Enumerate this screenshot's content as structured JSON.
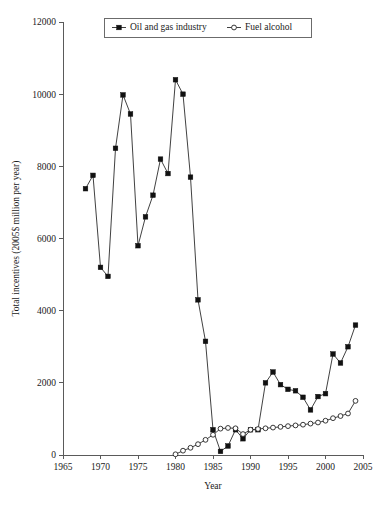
{
  "chart_data": {
    "type": "line",
    "title": "",
    "subtitle": "",
    "xlabel": "Year",
    "ylabel": "Total incentives (2005$ million per year)",
    "xlim": [
      1965,
      2005
    ],
    "ylim": [
      0,
      12000
    ],
    "xticks": [
      1965,
      1970,
      1975,
      1980,
      1985,
      1990,
      1995,
      2000,
      2005
    ],
    "yticks": [
      0,
      2000,
      4000,
      6000,
      8000,
      10000,
      12000
    ],
    "xtick_labels": [
      "1965",
      "1970",
      "1975",
      "1980",
      "1985",
      "1990",
      "1995",
      "2000",
      "2005"
    ],
    "ytick_labels": [
      "0",
      "2000",
      "4000",
      "6000",
      "8000",
      "10000",
      "12000"
    ],
    "grid": false,
    "legend_position": "top-center",
    "series": [
      {
        "name": "Oil and gas industry",
        "marker": "filled-square",
        "color": "#111111",
        "x": [
          1968,
          1969,
          1970,
          1971,
          1972,
          1973,
          1974,
          1975,
          1976,
          1977,
          1978,
          1979,
          1980,
          1981,
          1982,
          1983,
          1984,
          1985,
          1986,
          1987,
          1988,
          1989,
          1990,
          1991,
          1992,
          1993,
          1994,
          1995,
          1996,
          1997,
          1998,
          1999,
          2000,
          2001,
          2002,
          2003,
          2004
        ],
        "values": [
          7380,
          7750,
          5200,
          4950,
          8500,
          9980,
          9450,
          5800,
          6600,
          7200,
          8200,
          7800,
          10400,
          10000,
          7700,
          4300,
          3150,
          700,
          100,
          250,
          700,
          450,
          700,
          700,
          2000,
          2300,
          1950,
          1820,
          1780,
          1600,
          1250,
          1620,
          1700,
          2800,
          2550,
          3000,
          3600
        ]
      },
      {
        "name": "Fuel alcohol",
        "marker": "open-circle",
        "color": "#222222",
        "x": [
          1980,
          1981,
          1982,
          1983,
          1984,
          1985,
          1986,
          1987,
          1988,
          1989,
          1990,
          1991,
          1992,
          1993,
          1994,
          1995,
          1996,
          1997,
          1998,
          1999,
          2000,
          2001,
          2002,
          2003,
          2004
        ],
        "values": [
          20,
          120,
          200,
          300,
          420,
          560,
          730,
          750,
          740,
          580,
          700,
          720,
          740,
          760,
          780,
          800,
          820,
          840,
          870,
          900,
          950,
          1020,
          1080,
          1150,
          1500
        ]
      }
    ]
  },
  "legend": {
    "items": [
      {
        "label": "Oil and gas industry"
      },
      {
        "label": "Fuel alcohol"
      }
    ]
  }
}
